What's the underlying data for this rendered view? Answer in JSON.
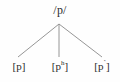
{
  "diagram": {
    "type": "tree",
    "kind": "phoneme-allophone-tree",
    "background_color": "#fefefe",
    "line_color": "#8a8a8a",
    "text_color": "#2b2b2b",
    "root": {
      "label": "/p/",
      "x": 59,
      "y": 24
    },
    "leaves": [
      {
        "label": "[p]",
        "base": "[p",
        "superscript": "",
        "tail": "]",
        "x": 18,
        "y": 57
      },
      {
        "label": "[pʰ]",
        "base": "[p",
        "superscript": "h",
        "tail": "]",
        "x": 59,
        "y": 57
      },
      {
        "label": "[p˺]",
        "base": "[p",
        "superscript": "˺",
        "tail": "]",
        "x": 102,
        "y": 57
      }
    ],
    "branches": [
      {
        "x1": 59,
        "y1": 24,
        "x2": 18,
        "y2": 57
      },
      {
        "x1": 59,
        "y1": 24,
        "x2": 59,
        "y2": 57
      },
      {
        "x1": 59,
        "y1": 24,
        "x2": 102,
        "y2": 57
      }
    ]
  }
}
